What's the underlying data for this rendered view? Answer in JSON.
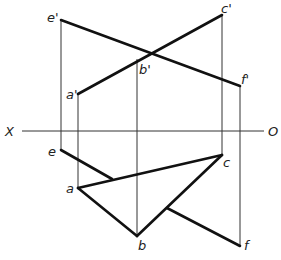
{
  "diagram": {
    "type": "orthographic-projection",
    "axis": {
      "left_label": "X",
      "right_label": "O"
    },
    "front_view": {
      "points": [
        {
          "name": "e'",
          "label": "e'"
        },
        {
          "name": "c'",
          "label": "c'"
        },
        {
          "name": "b'",
          "label": "b'"
        },
        {
          "name": "f'",
          "label": "f'"
        },
        {
          "name": "a'",
          "label": "a'"
        }
      ],
      "lines": [
        "e'f'",
        "a'c'"
      ]
    },
    "top_view": {
      "points": [
        {
          "name": "e",
          "label": "e"
        },
        {
          "name": "a",
          "label": "a"
        },
        {
          "name": "c",
          "label": "c"
        },
        {
          "name": "b",
          "label": "b"
        },
        {
          "name": "f",
          "label": "f"
        }
      ],
      "lines": [
        "ac",
        "ab",
        "bc",
        "ef"
      ]
    }
  }
}
